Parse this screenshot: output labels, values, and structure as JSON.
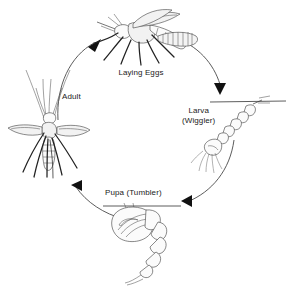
{
  "diagram": {
    "type": "cycle-diagram",
    "background_color": "#ffffff",
    "ink_color": "#2b2b2b",
    "stage_count": 4,
    "direction": "clockwise"
  },
  "labels": {
    "laying_eggs": "Laying Eggs",
    "adult": "Adult",
    "larva_line1": "Larva",
    "larva_line2": "(Wiggler)",
    "pupa": "Pupa (Tumbler)"
  },
  "stages": [
    {
      "id": "laying-eggs",
      "label": "Laying Eggs",
      "position": "top",
      "description": "Adult mosquito in side view depositing an egg raft on the water surface"
    },
    {
      "id": "larva",
      "label": "Larva (Wiggler)",
      "position": "right",
      "description": "Segmented larva hanging head-down from the water surface line"
    },
    {
      "id": "pupa",
      "label": "Pupa (Tumbler)",
      "position": "bottom",
      "description": "Comma-shaped pupa suspended beneath the water surface line"
    },
    {
      "id": "adult",
      "label": "Adult",
      "position": "left",
      "description": "Adult mosquito seen from above with outstretched wings and long legs"
    }
  ],
  "arrows": [
    {
      "id": "arrow-pupa-to-adult",
      "from": "pupa",
      "to": "adult",
      "points": "up-left"
    },
    {
      "id": "arrow-adult-to-laying-eggs",
      "from": "adult",
      "to": "laying-eggs",
      "points": "up-right"
    },
    {
      "id": "arrow-laying-eggs-to-larva",
      "from": "laying-eggs",
      "to": "larva",
      "points": "down-right"
    },
    {
      "id": "arrow-larva-to-pupa",
      "from": "larva",
      "to": "pupa",
      "points": "down-left"
    }
  ]
}
